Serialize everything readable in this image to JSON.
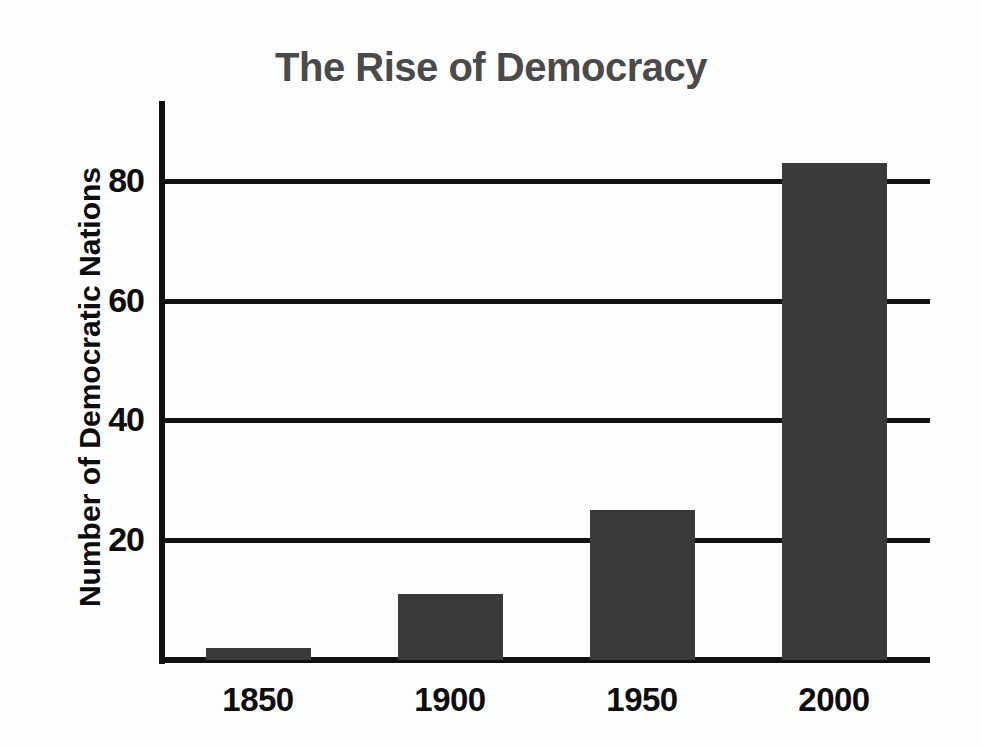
{
  "chart_data": {
    "type": "bar",
    "title": "The Rise of Democracy",
    "xlabel": "",
    "ylabel": "Number of Democratic Nations",
    "categories": [
      "1850",
      "1900",
      "1950",
      "2000"
    ],
    "values": [
      2,
      11,
      25,
      83
    ],
    "ylim": [
      0,
      93
    ],
    "y_ticks": [
      20,
      40,
      60,
      80
    ],
    "y_tick_labels": [
      "20",
      "40",
      "60",
      "80"
    ],
    "grid": true,
    "legend": "none",
    "series": [
      {
        "name": "Number of Democratic Nations",
        "values": [
          2,
          11,
          25,
          83
        ]
      }
    ]
  },
  "style": {
    "background_color": "#fdfdfd",
    "bar_color": "#3a3a3a",
    "title_color": "#4a4a4a",
    "axis_color": "#111111",
    "label_color": "#0d0d0d"
  }
}
